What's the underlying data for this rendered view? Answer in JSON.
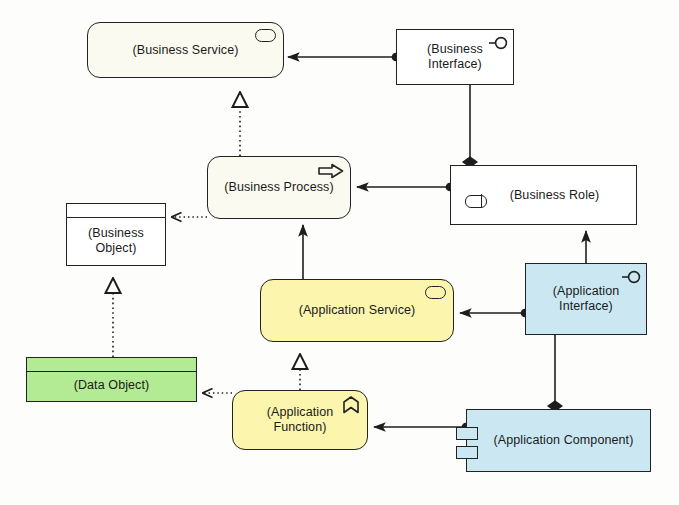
{
  "diagram": {
    "width": 679,
    "height": 505,
    "background": "#fdfdfc",
    "stroke": "#222222",
    "colors": {
      "business_service_fill": "#fbfaf0",
      "business_white_fill": "#ffffff",
      "application_yellow_fill": "#fbf5ae",
      "application_blue_fill": "#cbe8f2",
      "data_object_green_fill": "#b2eb93"
    }
  },
  "nodes": [
    {
      "id": "business-service",
      "label": "(Business Service)",
      "shape": "rounded-rectangle",
      "fill": "#fbfaf0",
      "icon": "oval-icon",
      "x": 87,
      "y": 22,
      "w": 197,
      "h": 56
    },
    {
      "id": "business-interface",
      "label": "(Business\nInterface)",
      "shape": "rectangle",
      "fill": "#ffffff",
      "icon": "lollipop-icon",
      "x": 396,
      "y": 29,
      "w": 118,
      "h": 56
    },
    {
      "id": "business-process",
      "label": "(Business Process)",
      "shape": "rounded-rectangle",
      "fill": "#fbfaf0",
      "icon": "arrow-icon",
      "x": 207,
      "y": 156,
      "w": 144,
      "h": 63
    },
    {
      "id": "business-role",
      "label": "(Business Role)",
      "shape": "rectangle",
      "fill": "#ffffff",
      "icon": "role-icon",
      "x": 450,
      "y": 165,
      "w": 187,
      "h": 60
    },
    {
      "id": "business-object",
      "label": "(Business\nObject)",
      "shape": "object-rectangle",
      "fill": "#ffffff",
      "icon": "object-divider",
      "x": 66,
      "y": 203,
      "w": 100,
      "h": 63
    },
    {
      "id": "application-service",
      "label": "(Application Service)",
      "shape": "rounded-rectangle",
      "fill": "#fbf5ae",
      "icon": "oval-icon",
      "x": 260,
      "y": 279,
      "w": 194,
      "h": 63
    },
    {
      "id": "application-interface",
      "label": "(Application\nInterface)",
      "shape": "rectangle",
      "fill": "#cbe8f2",
      "icon": "lollipop-icon",
      "x": 525,
      "y": 263,
      "w": 122,
      "h": 72
    },
    {
      "id": "data-object",
      "label": "(Data Object)",
      "shape": "object-rectangle",
      "fill": "#b2eb93",
      "icon": "object-divider",
      "x": 26,
      "y": 357,
      "w": 171,
      "h": 45
    },
    {
      "id": "application-function",
      "label": "(Application\nFunction)",
      "shape": "rounded-rectangle",
      "fill": "#fbf5ae",
      "icon": "chevron-up-icon",
      "x": 232,
      "y": 390,
      "w": 136,
      "h": 60
    },
    {
      "id": "application-component",
      "label": "(Application Component)",
      "shape": "component",
      "fill": "#cbe8f2",
      "icon": "component-tabs-icon",
      "x": 466,
      "y": 409,
      "w": 185,
      "h": 63
    }
  ],
  "edges": [
    {
      "id": "edge-interface-serves-service",
      "from": "business-interface",
      "to": "business-service",
      "type": "assignment",
      "style": "solid",
      "source_marker": "ball",
      "target_marker": "arrow"
    },
    {
      "id": "edge-process-realizes-service",
      "from": "business-process",
      "to": "business-service",
      "type": "realization",
      "style": "dotted",
      "source_marker": "none",
      "target_marker": "hollow-triangle"
    },
    {
      "id": "edge-role-composes-interface",
      "from": "business-role",
      "to": "business-interface",
      "type": "composition",
      "style": "solid",
      "source_marker": "filled-diamond",
      "target_marker": "none"
    },
    {
      "id": "edge-role-assigned-process",
      "from": "business-role",
      "to": "business-process",
      "type": "assignment",
      "style": "solid",
      "source_marker": "ball",
      "target_marker": "arrow"
    },
    {
      "id": "edge-process-accesses-object",
      "from": "business-process",
      "to": "business-object",
      "type": "access",
      "style": "dotted",
      "source_marker": "none",
      "target_marker": "open-arrow"
    },
    {
      "id": "edge-appservice-serves-process",
      "from": "application-service",
      "to": "business-process",
      "type": "serving",
      "style": "solid",
      "source_marker": "none",
      "target_marker": "arrow"
    },
    {
      "id": "edge-dataobject-realizes-businessobject",
      "from": "data-object",
      "to": "business-object",
      "type": "realization",
      "style": "dotted",
      "source_marker": "none",
      "target_marker": "hollow-triangle"
    },
    {
      "id": "edge-appfunction-realizes-appservice",
      "from": "application-function",
      "to": "application-service",
      "type": "realization",
      "style": "dotted",
      "source_marker": "none",
      "target_marker": "hollow-triangle"
    },
    {
      "id": "edge-appfunction-accesses-dataobject",
      "from": "application-function",
      "to": "data-object",
      "type": "access",
      "style": "dotted",
      "source_marker": "none",
      "target_marker": "open-arrow"
    },
    {
      "id": "edge-appinterface-serves-appservice",
      "from": "application-interface",
      "to": "application-service",
      "type": "assignment",
      "style": "solid",
      "source_marker": "ball",
      "target_marker": "arrow"
    },
    {
      "id": "edge-appinterface-serves-role",
      "from": "application-interface",
      "to": "business-role",
      "type": "serving",
      "style": "solid",
      "source_marker": "none",
      "target_marker": "arrow"
    },
    {
      "id": "edge-component-composes-appinterface",
      "from": "application-component",
      "to": "application-interface",
      "type": "composition",
      "style": "solid",
      "source_marker": "filled-diamond",
      "target_marker": "none"
    },
    {
      "id": "edge-component-assigned-appfunction",
      "from": "application-component",
      "to": "application-function",
      "type": "assignment",
      "style": "solid",
      "source_marker": "ball",
      "target_marker": "arrow"
    }
  ]
}
